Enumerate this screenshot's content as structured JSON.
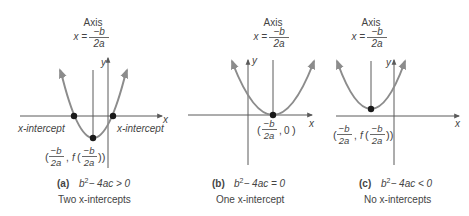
{
  "colors": {
    "curve": "#8c8c8c",
    "axis": "#5a5a5a",
    "point": "#1a1a1a",
    "text": "#444444"
  },
  "panels": [
    {
      "id": "a",
      "axis_label": "Axis",
      "axis_formula_lhs": "x =",
      "axis_formula_num": "−b",
      "axis_formula_den": "2a",
      "x_label": "x",
      "y_label": "y",
      "intercept_left_label": "x-intercept",
      "intercept_right_label": "x-intercept",
      "vertex_label": "(−b/2a, f(−b/2a))",
      "vertex_num": "−b",
      "vertex_den": "2a",
      "vertex_f": "f",
      "caption_letter": "(a)",
      "caption_condition_b": "b",
      "caption_condition_sup": "2",
      "caption_condition_rest": "− 4ac > 0",
      "caption_desc": "Two x-intercepts"
    },
    {
      "id": "b",
      "axis_label": "Axis",
      "axis_formula_lhs": "x =",
      "axis_formula_num": "−b",
      "axis_formula_den": "2a",
      "x_label": "x",
      "y_label": "y",
      "vertex_label": "(−b/2a, 0)",
      "vertex_num": "−b",
      "vertex_den": "2a",
      "vertex_y": "0",
      "caption_letter": "(b)",
      "caption_condition_b": "b",
      "caption_condition_sup": "2",
      "caption_condition_rest": "− 4ac = 0",
      "caption_desc": "One x-intercept"
    },
    {
      "id": "c",
      "axis_label": "Axis",
      "axis_formula_lhs": "x =",
      "axis_formula_num": "−b",
      "axis_formula_den": "2a",
      "x_label": "x",
      "y_label": "y",
      "vertex_label": "(−b/2a, f(−b/2a))",
      "vertex_num": "−b",
      "vertex_den": "2a",
      "vertex_f": "f",
      "caption_letter": "(c)",
      "caption_condition_b": "b",
      "caption_condition_sup": "2",
      "caption_condition_rest": "− 4ac < 0",
      "caption_desc": "No x-intercepts"
    }
  ]
}
